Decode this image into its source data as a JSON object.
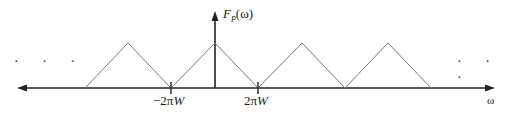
{
  "figure": {
    "title_label": {
      "main": "F",
      "subscript": "P",
      "arg": "(ω)"
    },
    "x_axis_label": "ω",
    "tick_labels": [
      {
        "text_prefix": "−2π",
        "text_var": "W",
        "x": 171
      },
      {
        "text_prefix": "2π",
        "text_var": "W",
        "x": 258
      }
    ],
    "ellipsis_left": "· · ·",
    "ellipsis_right": "· · ·",
    "colors": {
      "axis": "#222222",
      "triangle": "#777777"
    }
  }
}
